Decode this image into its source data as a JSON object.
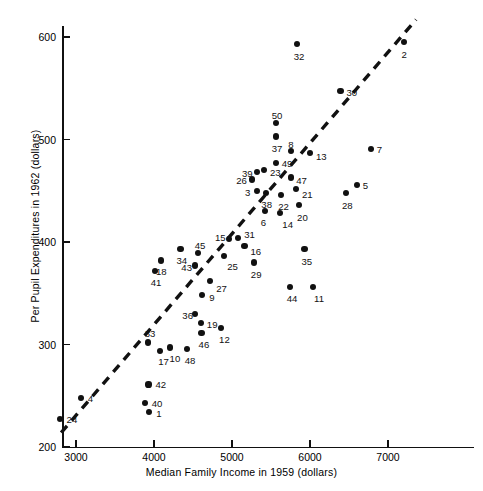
{
  "chart_data": {
    "type": "scatter",
    "title": "",
    "xlabel": "Median Family Income in 1959 (dollars)",
    "ylabel": "Per Pupil Expenditures in 1962 (dollars)",
    "xlim": [
      2600,
      7900
    ],
    "ylim": [
      200,
      630
    ],
    "xticks": [
      3000,
      4000,
      5000,
      6000,
      7000
    ],
    "yticks": [
      200,
      300,
      400,
      500,
      600
    ],
    "xtick_labels": [
      "3000",
      "4000",
      "5000",
      "6000",
      "7000"
    ],
    "ytick_labels": [
      "200",
      "300",
      "400",
      "500",
      "600"
    ],
    "grid": false,
    "legend": null,
    "point_label_key": "state index (1-50)",
    "points": [
      {
        "label": "24",
        "x": 2790,
        "y": 227
      },
      {
        "label": "4",
        "x": 3060,
        "y": 248
      },
      {
        "label": "40",
        "x": 3880,
        "y": 243
      },
      {
        "label": "1",
        "x": 3940,
        "y": 234
      },
      {
        "label": "42",
        "x": 3930,
        "y": 261
      },
      {
        "label": "33",
        "x": 3920,
        "y": 302
      },
      {
        "label": "17",
        "x": 4080,
        "y": 294
      },
      {
        "label": "10",
        "x": 4200,
        "y": 297
      },
      {
        "label": "48",
        "x": 4420,
        "y": 296
      },
      {
        "label": "46",
        "x": 4610,
        "y": 311
      },
      {
        "label": "19",
        "x": 4600,
        "y": 321
      },
      {
        "label": "12",
        "x": 4860,
        "y": 316
      },
      {
        "label": "36",
        "x": 4530,
        "y": 330
      },
      {
        "label": "9",
        "x": 4620,
        "y": 348
      },
      {
        "label": "41",
        "x": 4010,
        "y": 372
      },
      {
        "label": "18",
        "x": 4090,
        "y": 382
      },
      {
        "label": "43",
        "x": 4530,
        "y": 377
      },
      {
        "label": "27",
        "x": 4720,
        "y": 362
      },
      {
        "label": "34",
        "x": 4340,
        "y": 393
      },
      {
        "label": "45",
        "x": 4560,
        "y": 389
      },
      {
        "label": "25",
        "x": 4900,
        "y": 386
      },
      {
        "label": "15",
        "x": 4960,
        "y": 403
      },
      {
        "label": "31",
        "x": 5080,
        "y": 404
      },
      {
        "label": "16",
        "x": 5160,
        "y": 396
      },
      {
        "label": "29",
        "x": 5280,
        "y": 380
      },
      {
        "label": "44",
        "x": 5740,
        "y": 356
      },
      {
        "label": "11",
        "x": 6040,
        "y": 356
      },
      {
        "label": "35",
        "x": 5930,
        "y": 393
      },
      {
        "label": "6",
        "x": 5420,
        "y": 430
      },
      {
        "label": "14",
        "x": 5620,
        "y": 428
      },
      {
        "label": "20",
        "x": 5860,
        "y": 436
      },
      {
        "label": "22",
        "x": 5630,
        "y": 446
      },
      {
        "label": "3",
        "x": 5320,
        "y": 450
      },
      {
        "label": "38",
        "x": 5440,
        "y": 448
      },
      {
        "label": "21",
        "x": 5820,
        "y": 452
      },
      {
        "label": "26",
        "x": 5260,
        "y": 461
      },
      {
        "label": "39",
        "x": 5320,
        "y": 468
      },
      {
        "label": "47",
        "x": 5760,
        "y": 463
      },
      {
        "label": "23",
        "x": 5410,
        "y": 470
      },
      {
        "label": "49",
        "x": 5560,
        "y": 477
      },
      {
        "label": "28",
        "x": 6460,
        "y": 448
      },
      {
        "label": "5",
        "x": 6600,
        "y": 456
      },
      {
        "label": "8",
        "x": 5760,
        "y": 489
      },
      {
        "label": "13",
        "x": 6000,
        "y": 487
      },
      {
        "label": "7",
        "x": 6780,
        "y": 491
      },
      {
        "label": "37",
        "x": 5560,
        "y": 503
      },
      {
        "label": "50",
        "x": 5560,
        "y": 516
      },
      {
        "label": "30",
        "x": 6390,
        "y": 547
      },
      {
        "label": "32",
        "x": 5830,
        "y": 593
      },
      {
        "label": "2",
        "x": 7210,
        "y": 595
      }
    ],
    "fit_line": {
      "style": "dashed",
      "x_start": 2810,
      "y_start": 214,
      "x_end": 7360,
      "y_end": 617
    }
  }
}
